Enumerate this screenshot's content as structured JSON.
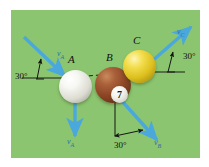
{
  "figure": {
    "kind": "physics-vector-diagram",
    "panel_background_color": "#8cc56f",
    "page_background_color": "#ffffff",
    "vector_color": "#4aa8dd",
    "axis_line_color": "#1d1d1d"
  },
  "balls": [
    {
      "id": "A",
      "label": "A",
      "color_name": "white",
      "color": "#f2f2ec"
    },
    {
      "id": "B",
      "label": "B",
      "color_name": "brown",
      "color": "#8b4424"
    },
    {
      "id": "C",
      "label": "C",
      "color_name": "yellow",
      "color": "#ddc01e"
    }
  ],
  "numbered_ball": {
    "number": "7"
  },
  "angles": [
    {
      "id": "incoming-left",
      "value": "30°"
    },
    {
      "id": "outgoing-right",
      "value": "30°"
    },
    {
      "id": "outgoing-bottom",
      "value": "30°"
    }
  ],
  "vectors": [
    {
      "id": "vA-incoming",
      "label": "v",
      "subscript": "A",
      "direction": "down-right"
    },
    {
      "id": "vA-outgoing",
      "label": "v",
      "subscript": "A",
      "direction": "down"
    },
    {
      "id": "vB-outgoing",
      "label": "v",
      "subscript": "B",
      "direction": "down-right"
    },
    {
      "id": "vC-outgoing",
      "label": "v",
      "subscript": "C",
      "direction": "up-right"
    }
  ]
}
